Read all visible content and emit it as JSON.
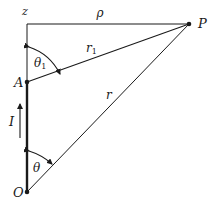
{
  "diagram": {
    "type": "geometry-figure",
    "labels": {
      "z_axis": "z",
      "rho": "ρ",
      "point_P": "P",
      "point_A": "A",
      "point_O": "O",
      "r1": "r",
      "r1_sub": "1",
      "r": "r",
      "theta1": "θ",
      "theta1_sub": "1",
      "theta": "θ",
      "current": "I"
    },
    "points": {
      "Z": {
        "x": 27,
        "y": 24
      },
      "P": {
        "x": 189,
        "y": 24
      },
      "A": {
        "x": 27,
        "y": 82
      },
      "O": {
        "x": 27,
        "y": 192
      }
    },
    "colors": {
      "line": "#1a1a1a",
      "background": "#ffffff"
    }
  }
}
